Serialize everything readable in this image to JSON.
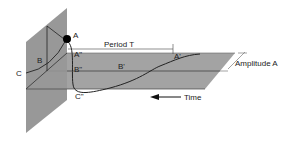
{
  "diagram": {
    "labels": {
      "A": "A",
      "B": "B",
      "C": "C",
      "A_prime": "A\"",
      "B_prime": "B\"",
      "C_prime": "C\"",
      "B_curve": "B'",
      "A_end": "A'",
      "period": "Period T",
      "amplitude": "Amplitude A",
      "time": "Time"
    },
    "colors": {
      "plane": "#9a9a9a",
      "plane_dark": "#8a8a8a",
      "line": "#222222",
      "point": "#000000"
    }
  }
}
